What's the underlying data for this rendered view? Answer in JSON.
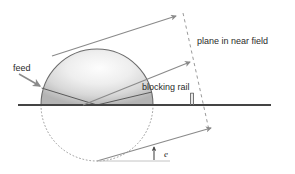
{
  "figure": {
    "type": "technical-diagram",
    "background_color": "#ffffff"
  },
  "labels": {
    "feed": "feed",
    "blocking_rail": "blocking rail",
    "plane_in_near_field": "plane in near field",
    "elevation_angle": "e"
  },
  "colors": {
    "baseline": "#444444",
    "ray": "#8a8a8a",
    "dome_outline": "#6b6b6b",
    "dome_fill_light": "#fcfcfc",
    "dome_fill_dark": "#b6b6b6",
    "dotted_circle": "#9a9a9a",
    "dashed_plane": "#9a9a9a",
    "text": "#2b2b2b",
    "rail": "#6e6e6e"
  },
  "geometry": {
    "circle": {
      "cx": 97,
      "cy": 105,
      "r": 56
    },
    "baseline": {
      "x1": 18,
      "y1": 105,
      "x2": 271,
      "y2": 105
    },
    "rail": {
      "x": 192,
      "y_top": 93,
      "y_bottom": 105
    },
    "plane_dashed": {
      "x1": 183,
      "y1": 13,
      "x2": 209,
      "y2": 130
    },
    "rays": [
      {
        "name": "upper-ray",
        "x1": 52,
        "y1": 56,
        "x2": 176,
        "y2": 16
      },
      {
        "name": "middle-ray",
        "x1": 83,
        "y1": 105,
        "x2": 190,
        "y2": 62
      },
      {
        "name": "lower-ray",
        "x1": 97,
        "y1": 161,
        "x2": 211,
        "y2": 128
      }
    ],
    "feed_pointer": {
      "x1": 18,
      "y1": 74,
      "x2": 40,
      "y2": 85
    },
    "angle_marker": {
      "x": 154,
      "y_top": 147,
      "y_bottom": 160
    }
  },
  "elements": {
    "dome": "shaded upper hemisphere",
    "dotted_lower": "dotted lower hemisphere",
    "reference_line": "light horizontal reference line at bottom"
  }
}
